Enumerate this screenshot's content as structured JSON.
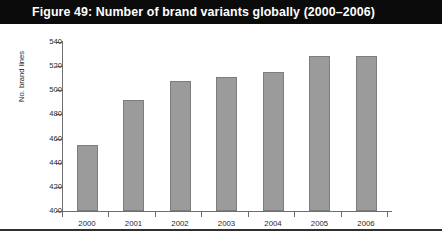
{
  "figure": {
    "title": "Figure 49: Number of brand variants globally (2000–2006)",
    "banner_color": "#0b0b0b",
    "banner_text_color": "#ffffff"
  },
  "chart_data": {
    "type": "bar",
    "title": "Figure 49: Number of brand variants globally (2000–2006)",
    "categories": [
      "2000",
      "2001",
      "2002",
      "2003",
      "2004",
      "2005",
      "2006"
    ],
    "values": [
      455,
      492,
      508,
      511,
      515,
      528,
      528
    ],
    "xlabel": "",
    "ylabel": "No. brand lines",
    "ylim": [
      400,
      540
    ],
    "ytick_step": 20,
    "yticks": [
      "540",
      "520",
      "500",
      "480",
      "460",
      "440",
      "420",
      "400"
    ],
    "grid": false,
    "legend": false,
    "bar_color": "#9b9b9b",
    "bar_border_color": "#7d7d7d",
    "axis_color": "#6e6e6e",
    "plot_background": "#ffffff"
  }
}
